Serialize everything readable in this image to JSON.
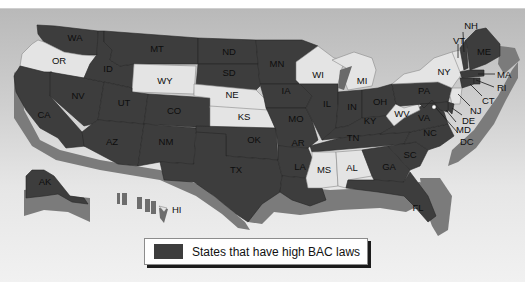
{
  "map": {
    "colors": {
      "high_bac_state": "#3d3d3d",
      "other_state": "#e4e4e4",
      "relief_edge": "#7b7b7b"
    },
    "states_high_bac": [
      "WA",
      "ID",
      "MT",
      "ND",
      "SD",
      "MN",
      "IA",
      "IL",
      "IN",
      "OH",
      "MI_upper_edge",
      "PA",
      "ME",
      "MA",
      "RI",
      "CT",
      "NJ",
      "DE",
      "MD",
      "VA",
      "NC",
      "SC",
      "GA",
      "FL",
      "TN",
      "KY",
      "AR",
      "LA",
      "MO",
      "OK",
      "TX",
      "NM",
      "AZ",
      "CO",
      "UT",
      "NV",
      "CA",
      "AK",
      "HI",
      "NH"
    ],
    "states_other": [
      "OR",
      "WY",
      "NE",
      "KS",
      "WI",
      "MI",
      "NY",
      "VT",
      "WV",
      "MS",
      "AL"
    ],
    "labels": {
      "WA": "WA",
      "OR": "OR",
      "CA": "CA",
      "NV": "NV",
      "ID": "ID",
      "MT": "MT",
      "WY": "WY",
      "UT": "UT",
      "CO": "CO",
      "AZ": "AZ",
      "NM": "NM",
      "ND": "ND",
      "SD": "SD",
      "NE": "NE",
      "KS": "KS",
      "OK": "OK",
      "TX": "TX",
      "MN": "MN",
      "IA": "IA",
      "MO": "MO",
      "AR": "AR",
      "LA": "LA",
      "WI": "WI",
      "IL": "IL",
      "MI": "MI",
      "IN": "IN",
      "OH": "OH",
      "KY": "KY",
      "TN": "TN",
      "MS": "MS",
      "AL": "AL",
      "GA": "GA",
      "FL": "FL",
      "SC": "SC",
      "NC": "NC",
      "VA": "VA",
      "WV": "WV",
      "PA": "PA",
      "NY": "NY",
      "VT": "VT",
      "NH": "NH",
      "ME": "ME",
      "MA": "MA",
      "RI": "RI",
      "CT": "CT",
      "NJ": "NJ",
      "DE": "DE",
      "MD": "MD",
      "DC": "DC",
      "AK": "AK",
      "HI": "HI"
    }
  },
  "legend": {
    "label": "States that have high BAC laws",
    "swatch_color": "#3d3d3d"
  }
}
